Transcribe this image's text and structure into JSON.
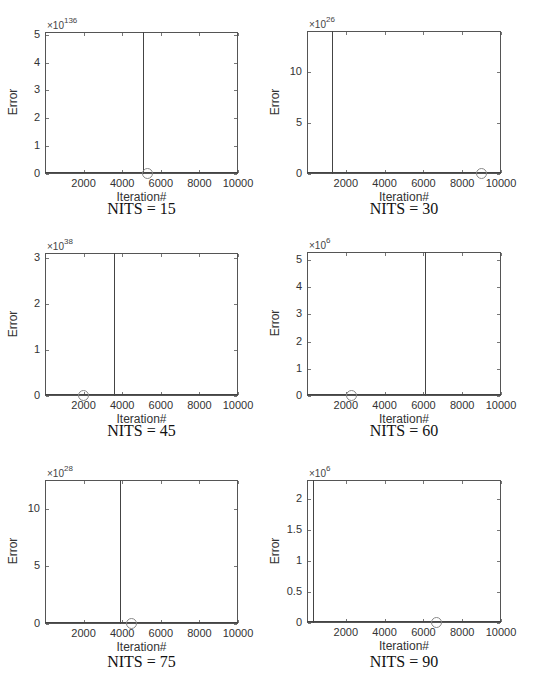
{
  "chart_data": [
    {
      "type": "line",
      "title": "NITS = 15",
      "xlabel": "Iteration#",
      "ylabel": "Error",
      "xlim": [
        0,
        10000
      ],
      "ylim": [
        0,
        5.1
      ],
      "y_exponent": "×10",
      "y_exponent_power": "136",
      "xticks": [
        "2000",
        "4000",
        "6000",
        "8000",
        "10000"
      ],
      "yticks": [
        "0",
        "1",
        "2",
        "3",
        "4",
        "5"
      ],
      "spike_iteration": 5100,
      "marker_iteration": 5300,
      "marker_value": 0,
      "grid": false
    },
    {
      "type": "line",
      "title": "NITS = 30",
      "xlabel": "Iteration#",
      "ylabel": "Error",
      "xlim": [
        0,
        10000
      ],
      "ylim": [
        0,
        14
      ],
      "y_exponent": "×10",
      "y_exponent_power": "26",
      "xticks": [
        "2000",
        "4000",
        "6000",
        "8000",
        "10000"
      ],
      "yticks": [
        "0",
        "5",
        "10"
      ],
      "spike_iteration": 1300,
      "marker_iteration": 9000,
      "marker_value": 0,
      "grid": false
    },
    {
      "type": "line",
      "title": "NITS = 45",
      "xlabel": "Iteration#",
      "ylabel": "Error",
      "xlim": [
        0,
        10000
      ],
      "ylim": [
        0,
        3.1
      ],
      "y_exponent": "×10",
      "y_exponent_power": "38",
      "xticks": [
        "2000",
        "4000",
        "6000",
        "8000",
        "10000"
      ],
      "yticks": [
        "0",
        "1",
        "2",
        "3"
      ],
      "spike_iteration": 3600,
      "marker_iteration": 2000,
      "marker_value": 0,
      "grid": false
    },
    {
      "type": "line",
      "title": "NITS = 60",
      "xlabel": "Iteration#",
      "ylabel": "Error",
      "xlim": [
        0,
        10000
      ],
      "ylim": [
        0,
        5.3
      ],
      "y_exponent": "×10",
      "y_exponent_power": "6",
      "xticks": [
        "2000",
        "4000",
        "6000",
        "8000",
        "10000"
      ],
      "yticks": [
        "0",
        "1",
        "2",
        "3",
        "4",
        "5"
      ],
      "spike_iteration": 6100,
      "marker_iteration": 2300,
      "marker_value": 0,
      "grid": false
    },
    {
      "type": "line",
      "title": "NITS = 75",
      "xlabel": "Iteration#",
      "ylabel": "Error",
      "xlim": [
        0,
        10000
      ],
      "ylim": [
        0,
        12.5
      ],
      "y_exponent": "×10",
      "y_exponent_power": "28",
      "xticks": [
        "2000",
        "4000",
        "6000",
        "8000",
        "10000"
      ],
      "yticks": [
        "0",
        "5",
        "10"
      ],
      "spike_iteration": 3900,
      "marker_iteration": 4500,
      "marker_value": 0,
      "grid": false
    },
    {
      "type": "line",
      "title": "NITS = 90",
      "xlabel": "Iteration#",
      "ylabel": "Error",
      "xlim": [
        0,
        10000
      ],
      "ylim": [
        0,
        2.3
      ],
      "y_exponent": "×10",
      "y_exponent_power": "6",
      "xticks": [
        "2000",
        "4000",
        "6000",
        "8000",
        "10000"
      ],
      "yticks": [
        "0",
        "0.5",
        "1",
        "1.5",
        "2"
      ],
      "spike_iteration": 300,
      "marker_iteration": 6700,
      "marker_value": 0,
      "grid": false
    }
  ],
  "layout": {
    "axes": [
      {
        "left": 45,
        "top": 32,
        "width": 193,
        "height": 142
      },
      {
        "left": 307,
        "top": 31,
        "width": 194,
        "height": 143
      },
      {
        "left": 45,
        "top": 253,
        "width": 193,
        "height": 143
      },
      {
        "left": 307,
        "top": 252,
        "width": 194,
        "height": 144
      },
      {
        "left": 45,
        "top": 480,
        "width": 193,
        "height": 144
      },
      {
        "left": 307,
        "top": 480,
        "width": 194,
        "height": 143
      }
    ],
    "caption_top": [
      200,
      200,
      422,
      422,
      653,
      653
    ]
  }
}
